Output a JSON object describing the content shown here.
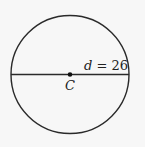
{
  "diagram": {
    "shape": "circle",
    "center_label": "C",
    "diameter_label_var": "d",
    "diameter_label_eq": " = ",
    "diameter_value": "26",
    "colors": {
      "stroke": "#2a2a2a",
      "background": "#f7f7f7"
    }
  }
}
